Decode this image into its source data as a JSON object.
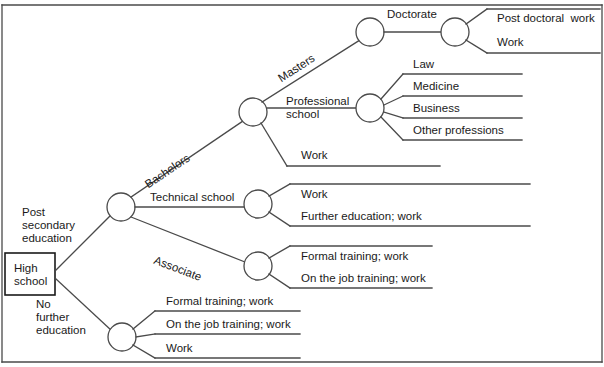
{
  "diagram": {
    "type": "decision-tree",
    "root": {
      "label": "High\nschool",
      "label_line1": "High",
      "label_line2": "school",
      "shape": "square"
    },
    "branch_labels": {
      "post_secondary": "Post\nsecondary\neducation",
      "post_secondary_l1": "Post",
      "post_secondary_l2": "secondary",
      "post_secondary_l3": "education",
      "no_further": "No\nfurther\neducation",
      "no_further_l1": "No",
      "no_further_l2": "further",
      "no_further_l3": "education",
      "bachelors": "Bachelors",
      "technical_school": "Technical school",
      "associate": "Associate",
      "masters": "Masters",
      "professional_school_l1": "Professional",
      "professional_school_l2": "school",
      "doctorate": "Doctorate"
    },
    "leaves": {
      "post_doctoral_work": "Post doctoral  work",
      "doctorate_work": "Work",
      "law": "Law",
      "medicine": "Medicine",
      "business": "Business",
      "other_professions": "Other professions",
      "bachelors_work": "Work",
      "technical_work": "Work",
      "technical_further": "Further education; work",
      "associate_formal": "Formal training; work",
      "associate_onjob": "On the job training; work",
      "nofurther_formal": "Formal training; work",
      "nofurther_onjob": "On the job training; work",
      "nofurther_work": "Work"
    },
    "colors": {
      "line": "#4a4a4a",
      "text": "#1a1a1a",
      "background": "#ffffff"
    }
  }
}
